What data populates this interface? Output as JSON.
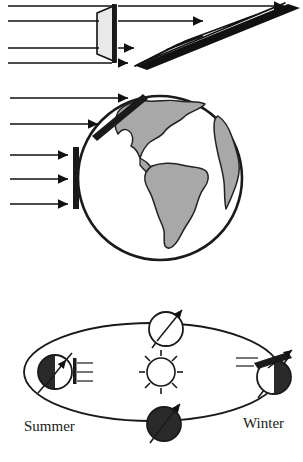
{
  "figure": {
    "background_color": "#ffffff",
    "width": 303,
    "height": 462,
    "ink_color": "#1a1a1a",
    "land_color": "#a8a8a8",
    "beam_face_color": "#e8e8e8"
  },
  "panel_top": {
    "name": "beam-spreading-panel",
    "description": "Parallel light rays strike a flat perpendicular surface and a steeply slanted surface",
    "ray_count": 4,
    "ray_labels": [
      "ray-1",
      "ray-2",
      "ray-3",
      "ray-4"
    ],
    "surfaces": [
      {
        "id": "perpendicular-surface",
        "orientation": "vertical",
        "label": ""
      },
      {
        "id": "oblique-surface",
        "orientation": "slanted",
        "label": ""
      }
    ]
  },
  "panel_globe": {
    "name": "globe-panel",
    "description": "Globe showing the Americas with direct sunlight at the equator and oblique sunlight at high latitude",
    "continents": [
      "North America",
      "South America",
      "Africa"
    ],
    "arrow_groups": [
      {
        "id": "oblique-rays",
        "count": 2,
        "target": "high-latitude-bar"
      },
      {
        "id": "direct-rays",
        "count": 3,
        "target": "equatorial-bar"
      }
    ]
  },
  "panel_orbit": {
    "name": "orbit-panel",
    "description": "Earth orbiting the Sun at four positions with a tilted rotation axis",
    "sun": {
      "name": "sun",
      "ray_count": 8
    },
    "positions": [
      {
        "id": "left-position",
        "label": "Summer",
        "lit_side": "right",
        "dark_side": "left"
      },
      {
        "id": "top-position",
        "label": "",
        "lit_side": "all",
        "dark_side": "none"
      },
      {
        "id": "right-position",
        "label": "Winter",
        "lit_side": "left",
        "dark_side": "right"
      },
      {
        "id": "bottom-position",
        "label": "",
        "lit_side": "none",
        "dark_side": "all"
      }
    ],
    "labels": {
      "summer": "Summer",
      "winter": "Winter"
    },
    "sunray_line_count_left": 3,
    "sunray_line_count_right": 2
  }
}
